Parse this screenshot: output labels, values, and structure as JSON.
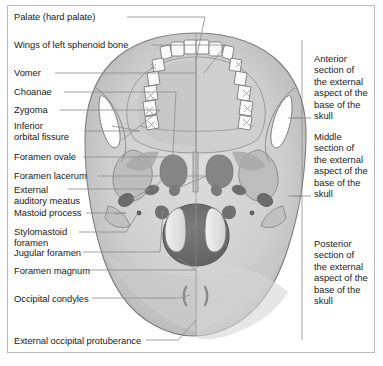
{
  "figure": {
    "title": "External aspect of the base of the skull",
    "frame_color": "#b9b9b9",
    "background": "#ffffff",
    "leader_line_color": "#8a8a8a",
    "bracket_color": "#8a8a8a"
  },
  "left_labels": [
    {
      "id": "palate",
      "text": "Palate (hard palate)"
    },
    {
      "id": "wings-sphenoid",
      "text": "Wings of left sphenoid bone"
    },
    {
      "id": "vomer",
      "text": "Vomer"
    },
    {
      "id": "choanae",
      "text": "Choanae"
    },
    {
      "id": "zygoma",
      "text": "Zygoma"
    },
    {
      "id": "inferior-orbital-fissure",
      "text": "Inferior\norbital fissure"
    },
    {
      "id": "foramen-ovale",
      "text": "Foramen ovale"
    },
    {
      "id": "foramen-lacerum",
      "text": "Foramen lacerum"
    },
    {
      "id": "external-auditory-meatus",
      "text": "External\nauditory meatus"
    },
    {
      "id": "mastoid-process",
      "text": "Mastoid process"
    },
    {
      "id": "stylomastoid-foramen",
      "text": "Stylomastoid\nforamen"
    },
    {
      "id": "jugular-foramen",
      "text": "Jugular foramen"
    },
    {
      "id": "foramen-magnum",
      "text": "Foramen magnum"
    },
    {
      "id": "occipital-condyles",
      "text": "Occipital condyles"
    },
    {
      "id": "external-occipital-protuberance",
      "text": "External occipital protuberance"
    }
  ],
  "right_sections": [
    {
      "id": "anterior",
      "text": "Anterior\nsection of\nthe external\naspect of the\nbase of the\nskull"
    },
    {
      "id": "middle",
      "text": "Middle\nsection of\nthe external\naspect of the\nbase of the\nskull"
    },
    {
      "id": "posterior",
      "text": "Posterior\nsection of\nthe external\naspect of the\nbase of the\nskull"
    }
  ],
  "illustration": {
    "view": "inferior view of skull base",
    "palette": {
      "bone_light": "#d8d8d8",
      "bone_mid": "#c2c2c2",
      "bone_dark": "#a8a8a8",
      "shadow": "#8e8e8e",
      "deep_shadow": "#6e6e6e",
      "foramen_magnum": "#6a6a6a",
      "tooth": "#fbfbfb",
      "outline": "#6f6f6f"
    },
    "structures": [
      "maxillary dental arch with incisors, canines, premolars and molars",
      "hard palate",
      "vomer and choanae",
      "inferior orbital fissures",
      "zygomatic arches",
      "foramen ovale",
      "foramen lacerum",
      "external auditory meatus",
      "mastoid processes",
      "stylomastoid foramen",
      "jugular foramen",
      "foramen magnum",
      "occipital condyles",
      "external occipital protuberance"
    ]
  }
}
